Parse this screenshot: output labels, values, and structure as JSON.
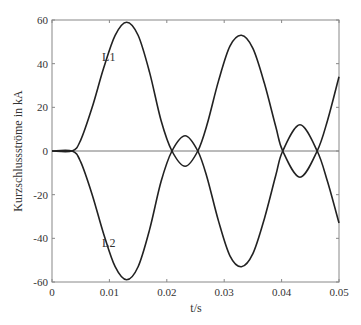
{
  "chart_data": {
    "type": "line",
    "title": "",
    "xlabel": "t/s",
    "ylabel": "Kurzschlussströme in kA",
    "xlim": [
      0,
      0.05
    ],
    "ylim": [
      -60,
      60
    ],
    "grid": false,
    "legend": "inline labels",
    "x_ticks": [
      "0",
      "0.01",
      "0.02",
      "0.03",
      "0.04",
      "0.05"
    ],
    "y_ticks": [
      "60",
      "40",
      "20",
      "0",
      "-20",
      "-40",
      "-60"
    ],
    "series": [
      {
        "name": "L1",
        "label_pos": [
          0.0035,
          43
        ],
        "x": [
          0,
          0.0035,
          0.005,
          0.007,
          0.009,
          0.011,
          0.013,
          0.015,
          0.017,
          0.019,
          0.0209,
          0.0232,
          0.0254,
          0.027,
          0.029,
          0.031,
          0.033,
          0.035,
          0.037,
          0.039,
          0.0402,
          0.0432,
          0.0462,
          0.048,
          0.05
        ],
        "values": [
          0,
          0,
          5,
          20,
          38,
          53,
          59,
          53,
          36,
          14,
          0,
          -7,
          0,
          12,
          32,
          48,
          53,
          47,
          31,
          11,
          0,
          -12,
          0,
          14,
          34
        ]
      },
      {
        "name": "L2",
        "label_pos": [
          0.0035,
          -42
        ],
        "x": [
          0,
          0.0035,
          0.005,
          0.007,
          0.009,
          0.011,
          0.013,
          0.015,
          0.017,
          0.019,
          0.0209,
          0.0232,
          0.0254,
          0.027,
          0.029,
          0.031,
          0.033,
          0.035,
          0.037,
          0.039,
          0.0402,
          0.0432,
          0.0462,
          0.048,
          0.05
        ],
        "values": [
          0,
          0,
          -5,
          -20,
          -38,
          -53,
          -59,
          -53,
          -36,
          -14,
          0,
          7,
          0,
          -12,
          -32,
          -48,
          -53,
          -47,
          -31,
          -11,
          0,
          12,
          0,
          -14,
          -33
        ]
      }
    ]
  }
}
